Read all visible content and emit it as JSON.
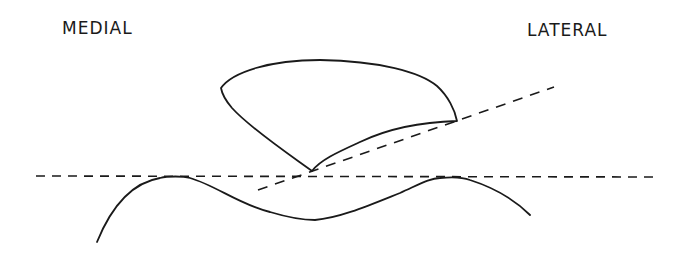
{
  "labels": {
    "medial": "MEDIAL",
    "lateral": "LATERAL"
  },
  "colors": {
    "ink": "#1a1a1a",
    "background": "#ffffff"
  },
  "diagram": {
    "elements": [
      {
        "name": "horizontal-reference-line",
        "style": "dashed",
        "from": [
          36,
          176
        ],
        "to": [
          660,
          177
        ]
      },
      {
        "name": "oblique-reference-line",
        "style": "dashed",
        "from": [
          258,
          190
        ],
        "to": [
          554,
          87
        ]
      },
      {
        "name": "upper-wedge-shape",
        "style": "solid",
        "vertices": [
          [
            221,
            88
          ],
          [
            457,
            121
          ],
          [
            312,
            171
          ]
        ]
      },
      {
        "name": "lower-wave-surface",
        "style": "solid",
        "points": [
          [
            97,
            242
          ],
          [
            175,
            176
          ],
          [
            315,
            220
          ],
          [
            450,
            178
          ],
          [
            530,
            215
          ]
        ]
      }
    ]
  }
}
